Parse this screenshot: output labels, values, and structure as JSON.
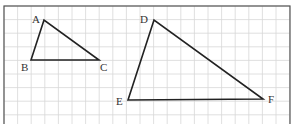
{
  "figure": {
    "grid": {
      "x0": 4,
      "y0": 6,
      "x1": 290,
      "y1": 124,
      "step": 13.6,
      "line_color": "#d8d8d8",
      "border_color": "#555555"
    },
    "triangles": [
      {
        "name": "ABC",
        "vertices": [
          {
            "label": "A",
            "x": 44,
            "y": 20,
            "lx": 32,
            "ly": 14
          },
          {
            "label": "B",
            "x": 31,
            "y": 60,
            "lx": 21,
            "ly": 62
          },
          {
            "label": "C",
            "x": 99,
            "y": 60,
            "lx": 100,
            "ly": 62
          }
        ]
      },
      {
        "name": "DEF",
        "vertices": [
          {
            "label": "D",
            "x": 154,
            "y": 20,
            "lx": 140,
            "ly": 14
          },
          {
            "label": "E",
            "x": 128,
            "y": 100,
            "lx": 116,
            "ly": 96
          },
          {
            "label": "F",
            "x": 263,
            "y": 99,
            "lx": 268,
            "ly": 94
          }
        ]
      }
    ],
    "stroke_color": "#222222"
  }
}
